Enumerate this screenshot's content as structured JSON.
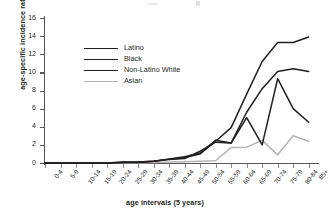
{
  "chart_data": {
    "type": "line",
    "title": "",
    "xlabel": "age intervals (5 years)",
    "ylabel": "age-specific incidence rate",
    "categories": [
      "0-4",
      "5-9",
      "10-14",
      "15-19",
      "20-24",
      "25-29",
      "30-34",
      "35-39",
      "40-44",
      "45-49",
      "50-54",
      "55-59",
      "60-64",
      "65-69",
      "70-74",
      "75-79",
      "80-84",
      "85+"
    ],
    "ylim": [
      0,
      16
    ],
    "yticks": [
      0,
      2,
      4,
      6,
      8,
      10,
      12,
      14,
      16
    ],
    "xlim_categories": 18,
    "grid": false,
    "legend_position": "upper-left-inside",
    "series": [
      {
        "name": "Latino",
        "color": "#231f20",
        "width": 1.5,
        "values": [
          0,
          0,
          0,
          0,
          0,
          0.05,
          0.05,
          0.2,
          0.4,
          0.6,
          1.0,
          2.4,
          3.9,
          7.6,
          11.2,
          13.3,
          13.3,
          13.9
        ]
      },
      {
        "name": "Black",
        "color": "#231f20",
        "width": 1.5,
        "values": [
          0,
          0,
          0,
          0,
          0,
          0.1,
          0.1,
          0.2,
          0.4,
          0.5,
          1.3,
          2.3,
          2.2,
          5.0,
          2.0,
          9.3,
          6.0,
          4.5
        ]
      },
      {
        "name": "Non-Latino White",
        "color": "#231f20",
        "width": 1.5,
        "values": [
          0,
          0,
          0,
          0,
          0,
          0.05,
          0.1,
          0.2,
          0.45,
          0.7,
          1.1,
          2.5,
          2.2,
          5.6,
          8.2,
          10.1,
          10.4,
          10.1
        ]
      },
      {
        "name": "Asian",
        "color": "#b3b3b3",
        "width": 1.5,
        "values": [
          0,
          0,
          0,
          0,
          0,
          0,
          0,
          0.05,
          0.1,
          0.15,
          0.2,
          0.25,
          1.7,
          1.75,
          2.5,
          0.9,
          3.0,
          2.4
        ]
      }
    ]
  },
  "legend": {
    "items": [
      {
        "label": "Latino",
        "color": "#231f20"
      },
      {
        "label": "Black",
        "color": "#231f20"
      },
      {
        "label": "Non-Latino White",
        "color": "#231f20"
      },
      {
        "label": "Asian",
        "color": "#b3b3b3"
      }
    ]
  },
  "axes": {
    "y_title": "age-specific incidence rate",
    "x_title": "age intervals (5 years)"
  }
}
